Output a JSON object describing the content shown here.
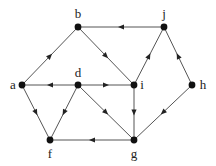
{
  "diagram": {
    "type": "directed-graph",
    "nodes": [
      {
        "id": "b",
        "label": "b",
        "x": 78,
        "y": 27,
        "lx": 78,
        "ly": 18,
        "anchor": "middle"
      },
      {
        "id": "j",
        "label": "j",
        "x": 164,
        "y": 27,
        "lx": 164,
        "ly": 18,
        "anchor": "middle"
      },
      {
        "id": "a",
        "label": "a",
        "x": 22,
        "y": 85,
        "lx": 13,
        "ly": 89,
        "anchor": "middle"
      },
      {
        "id": "d",
        "label": "d",
        "x": 78,
        "y": 85,
        "lx": 78,
        "ly": 77,
        "anchor": "middle"
      },
      {
        "id": "i",
        "label": "i",
        "x": 134,
        "y": 85,
        "lx": 142,
        "ly": 89,
        "anchor": "middle"
      },
      {
        "id": "h",
        "label": "h",
        "x": 192,
        "y": 85,
        "lx": 203,
        "ly": 89,
        "anchor": "middle"
      },
      {
        "id": "f",
        "label": "f",
        "x": 50,
        "y": 140,
        "lx": 50,
        "ly": 158,
        "anchor": "middle"
      },
      {
        "id": "g",
        "label": "g",
        "x": 134,
        "y": 140,
        "lx": 134,
        "ly": 158,
        "anchor": "middle"
      }
    ],
    "edges": [
      {
        "from": "j",
        "to": "b"
      },
      {
        "from": "b",
        "to": "i"
      },
      {
        "from": "a",
        "to": "b"
      },
      {
        "from": "d",
        "to": "a"
      },
      {
        "from": "d",
        "to": "i"
      },
      {
        "from": "i",
        "to": "j"
      },
      {
        "from": "h",
        "to": "j"
      },
      {
        "from": "a",
        "to": "f"
      },
      {
        "from": "d",
        "to": "f"
      },
      {
        "from": "d",
        "to": "g"
      },
      {
        "from": "i",
        "to": "g"
      },
      {
        "from": "g",
        "to": "f"
      },
      {
        "from": "h",
        "to": "g"
      }
    ],
    "colors": {
      "edge": "#555555",
      "node": "#111111",
      "arrow": "#222222",
      "label": "#222222",
      "background": "#ffffff"
    }
  }
}
